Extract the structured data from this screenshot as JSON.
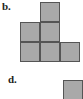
{
  "page": {
    "kind": "multiple-choice-figure-options",
    "background_color": "#ffffff",
    "width": 83,
    "height": 99
  },
  "style": {
    "cell_fill_color": "#a9a9a9",
    "cell_border_color": "#555555",
    "label_color": "#231f20",
    "cell_size_px": 20
  },
  "options": [
    {
      "id": "option-b",
      "label": "b.",
      "label_x": 2,
      "label_y": 1,
      "figure": {
        "name": "polyomino-p-shape",
        "origin_x": 20,
        "origin_y": 2,
        "cell_size": 20,
        "cell_count": 5,
        "grid_cols": 3,
        "grid_rows": 3,
        "cells": [
          {
            "col": 1,
            "row": 0
          },
          {
            "col": 0,
            "row": 1
          },
          {
            "col": 1,
            "row": 1
          },
          {
            "col": 0,
            "row": 2
          },
          {
            "col": 1,
            "row": 2
          },
          {
            "col": 2,
            "row": 2
          }
        ]
      }
    },
    {
      "id": "option-d",
      "label": "d.",
      "label_x": 8,
      "label_y": 74,
      "figure": {
        "name": "single-square",
        "origin_x": 63,
        "origin_y": 80,
        "cell_size": 20,
        "cell_count": 1,
        "grid_cols": 1,
        "grid_rows": 1,
        "cells": [
          {
            "col": 0,
            "row": 0
          }
        ]
      }
    }
  ]
}
